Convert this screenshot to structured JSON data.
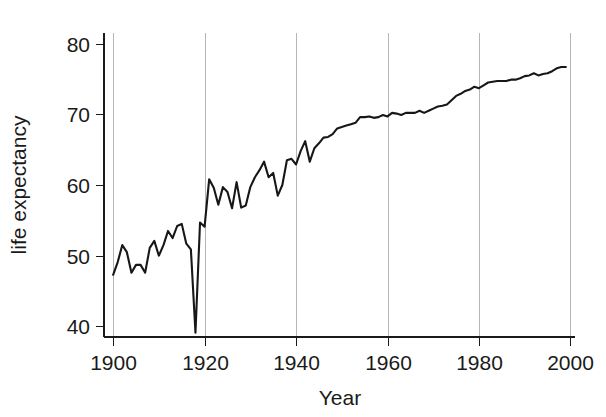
{
  "chart_data": {
    "type": "line",
    "title": "",
    "subtitle": "",
    "xlabel": "Year",
    "ylabel": "life expectancy",
    "xlim": [
      1898,
      2001
    ],
    "ylim": [
      38.5,
      81.5
    ],
    "xticks": [
      1900,
      1920,
      1940,
      1960,
      1980,
      2000
    ],
    "xtick_labels": [
      "1900",
      "1920",
      "1940",
      "1960",
      "1980",
      "2000"
    ],
    "yticks": [
      40,
      50,
      60,
      70,
      80
    ],
    "ytick_labels": [
      "40",
      "50",
      "60",
      "70",
      "80"
    ],
    "grid": "vertical-only",
    "legend": "none",
    "line_color": "#171717",
    "gridline_color": "#b5b5b5",
    "axis_color": "#1a1a1a",
    "background_color": "#ffffff",
    "annotations": [],
    "series": [
      {
        "name": "life expectancy",
        "x": [
          1900,
          1901,
          1902,
          1903,
          1904,
          1905,
          1906,
          1907,
          1908,
          1909,
          1910,
          1911,
          1912,
          1913,
          1914,
          1915,
          1916,
          1917,
          1918,
          1919,
          1920,
          1921,
          1922,
          1923,
          1924,
          1925,
          1926,
          1927,
          1928,
          1929,
          1930,
          1931,
          1932,
          1933,
          1934,
          1935,
          1936,
          1937,
          1938,
          1939,
          1940,
          1941,
          1942,
          1943,
          1944,
          1945,
          1946,
          1947,
          1948,
          1949,
          1950,
          1951,
          1952,
          1953,
          1954,
          1955,
          1956,
          1957,
          1958,
          1959,
          1960,
          1961,
          1962,
          1963,
          1964,
          1965,
          1966,
          1967,
          1968,
          1969,
          1970,
          1971,
          1972,
          1973,
          1974,
          1975,
          1976,
          1977,
          1978,
          1979,
          1980,
          1981,
          1982,
          1983,
          1984,
          1985,
          1986,
          1987,
          1988,
          1989,
          1990,
          1991,
          1992,
          1993,
          1994,
          1995,
          1996,
          1997,
          1998,
          1999
        ],
        "values": [
          47.3,
          49.1,
          51.5,
          50.5,
          47.6,
          48.7,
          48.7,
          47.6,
          51.1,
          52.1,
          50.0,
          51.5,
          53.5,
          52.5,
          54.2,
          54.5,
          51.7,
          50.9,
          39.1,
          54.7,
          54.1,
          60.8,
          59.6,
          57.2,
          59.7,
          59.0,
          56.7,
          60.4,
          56.8,
          57.1,
          59.7,
          61.1,
          62.1,
          63.3,
          61.1,
          61.7,
          58.5,
          60.0,
          63.5,
          63.7,
          62.9,
          64.8,
          66.2,
          63.3,
          65.2,
          65.9,
          66.7,
          66.8,
          67.2,
          68.0,
          68.2,
          68.4,
          68.6,
          68.8,
          69.6,
          69.6,
          69.7,
          69.5,
          69.6,
          69.9,
          69.7,
          70.2,
          70.1,
          69.9,
          70.2,
          70.2,
          70.2,
          70.5,
          70.2,
          70.5,
          70.8,
          71.1,
          71.2,
          71.4,
          72.0,
          72.6,
          72.9,
          73.3,
          73.5,
          73.9,
          73.7,
          74.1,
          74.5,
          74.6,
          74.7,
          74.7,
          74.7,
          74.9,
          74.9,
          75.1,
          75.4,
          75.5,
          75.8,
          75.5,
          75.7,
          75.8,
          76.1,
          76.5,
          76.7,
          76.7
        ]
      }
    ]
  },
  "figure": {
    "x_axis_title": "Year",
    "y_axis_title": "life expectancy"
  }
}
